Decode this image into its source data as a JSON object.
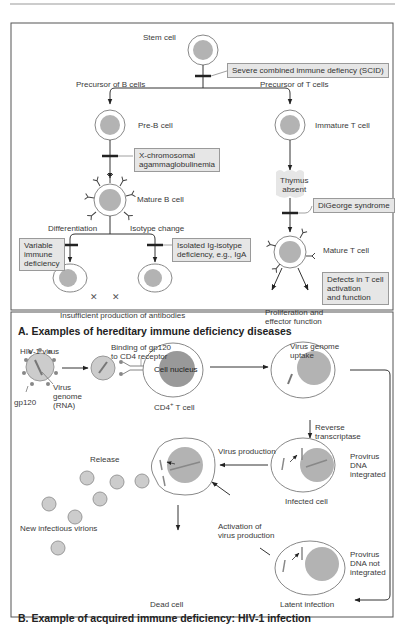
{
  "header": {
    "text": "Immune Deficiency Diseases"
  },
  "panel_a": {
    "title": "A. Examples of hereditary immune deficiency diseases",
    "labels": {
      "stem_cell": "Stem cell",
      "precursor_b": "Precursor of B cells",
      "precursor_t": "Precursor of T cells",
      "pre_b": "Pre-B cell",
      "mature_b": "Mature B cell",
      "immature_t": "Immature T cell",
      "thymus_absent_1": "Thymus",
      "thymus_absent_2": "absent",
      "mature_t": "Mature T cell",
      "differentiation": "Differentiation",
      "isotype_change": "Isotype change",
      "insufficient": "Insufficient production of antibodies",
      "prolif_1": "Proliferation and",
      "prolif_2": "effector function"
    },
    "defects": {
      "scid": "Severe combined immune defiency (SCID)",
      "xla_1": "X-chromosomal",
      "xla_2": "agammaglobulinemia",
      "variable_1": "Variable",
      "variable_2": "immune",
      "variable_3": "deficiency",
      "isolated_1": "Isolated Ig-isotype",
      "isolated_2": "deficiency, e.g., IgA",
      "digeorge": "DiGeorge syndrome",
      "tcell_1": "Defects in T cell",
      "tcell_2": "activation",
      "tcell_3": "and function"
    }
  },
  "panel_b": {
    "title": "B. Example of acquired immune deficiency: HIV-1 infection",
    "labels": {
      "hiv": "HIV-1 virus",
      "gp120": "gp120",
      "genome_1": "Virus",
      "genome_2": "genome",
      "genome_3": "(RNA)",
      "binding_1": "Binding of gp120",
      "binding_2": "to CD4 receptor",
      "nucleus": "Cell nucleus",
      "cd4": "CD4",
      "cd4_sup": "+",
      "cd4_rest": " T cell",
      "uptake_1": "Virus genome",
      "uptake_2": "uptake",
      "rt_1": "Reverse",
      "rt_2": "transcriptase",
      "release": "Release",
      "virus_production": "Virus production",
      "provirus_int_1": "Provirus",
      "provirus_int_2": "DNA",
      "provirus_int_3": "integrated",
      "infected": "Infected cell",
      "new_virions": "New infectious virions",
      "activation_1": "Activation of",
      "activation_2": "virus production",
      "provirus_not_1": "Provirus",
      "provirus_not_2": "DNA not",
      "provirus_not_3": "integrated",
      "dead": "Dead cell",
      "latent": "Latent infection"
    }
  },
  "colors": {
    "nucleus": "#b3b3b3",
    "box_fill": "#e6e6e6",
    "line": "#333333"
  }
}
